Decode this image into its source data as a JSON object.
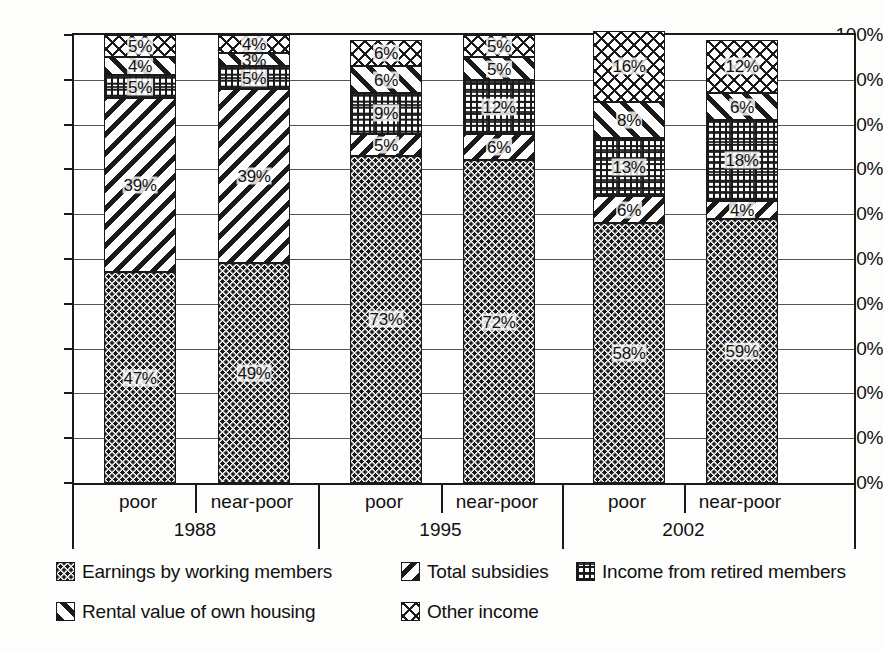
{
  "chart_data": {
    "type": "bar",
    "subtype": "stacked-100-percent",
    "title": "",
    "xlabel": "",
    "ylabel": "",
    "ylim": [
      0,
      100
    ],
    "ytick_labels": [
      "0%",
      "10%",
      "20%",
      "30%",
      "40%",
      "50%",
      "60%",
      "70%",
      "80%",
      "90%",
      "100%"
    ],
    "ytick_values": [
      0,
      10,
      20,
      30,
      40,
      50,
      60,
      70,
      80,
      90,
      100
    ],
    "grid": true,
    "legend_position": "bottom",
    "categories": [
      "poor",
      "near-poor",
      "poor",
      "near-poor",
      "poor",
      "near-poor"
    ],
    "groups": [
      {
        "label": "1988",
        "categories": [
          "poor",
          "near-poor"
        ]
      },
      {
        "label": "1995",
        "categories": [
          "poor",
          "near-poor"
        ]
      },
      {
        "label": "2002",
        "categories": [
          "poor",
          "near-poor"
        ]
      }
    ],
    "series": [
      {
        "name": "Earnings by working members",
        "pattern": "stipple-dots",
        "values": [
          47,
          49,
          73,
          72,
          58,
          59
        ]
      },
      {
        "name": "Total subsidies",
        "pattern": "backslash-hatch",
        "values": [
          39,
          39,
          5,
          6,
          6,
          4
        ]
      },
      {
        "name": "Income from retired members",
        "pattern": "dotted-grid",
        "values": [
          5,
          5,
          9,
          12,
          13,
          18
        ]
      },
      {
        "name": "Rental value of own housing",
        "pattern": "slash-hatch",
        "values": [
          4,
          3,
          6,
          5,
          8,
          6
        ]
      },
      {
        "name": "Other income",
        "pattern": "zigzag",
        "values": [
          5,
          4,
          6,
          5,
          16,
          12
        ]
      }
    ],
    "bar_labels": [
      [
        "47%",
        "49%",
        "73%",
        "72%",
        "58%",
        "59%"
      ],
      [
        "39%",
        "39%",
        "5%",
        "6%",
        "6%",
        "4%"
      ],
      [
        "5%",
        "5%",
        "9%",
        "12%",
        "13%",
        "18%"
      ],
      [
        "4%",
        "3%",
        "6%",
        "5%",
        "8%",
        "6%"
      ],
      [
        "5%",
        "4%",
        "6%",
        "5%",
        "16%",
        "12%"
      ]
    ]
  },
  "legend": {
    "rows": [
      [
        {
          "label": "Earnings by working members",
          "pattern": "stipple-dots"
        },
        {
          "label": "Total subsidies",
          "pattern": "backslash-hatch"
        },
        {
          "label": "Income from retired members",
          "pattern": "dotted-grid"
        }
      ],
      [
        {
          "label": "Rental value of own housing",
          "pattern": "slash-hatch"
        },
        {
          "label": "Other income",
          "pattern": "zigzag"
        }
      ]
    ]
  },
  "colors": {
    "ink": "#1a1a1a",
    "grid": "#555555",
    "background": "#ffffff"
  }
}
